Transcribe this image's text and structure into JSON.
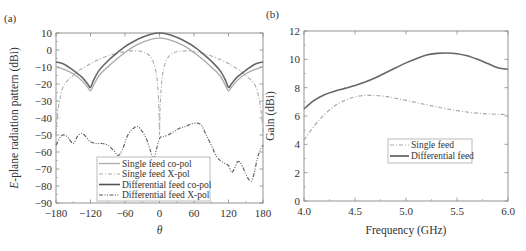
{
  "chart_data": [
    {
      "panel": "(a)",
      "type": "line",
      "xlabel": "θ",
      "ylabel_italic": "E",
      "ylabel_rest": "-plane radiation pattern (dBi)",
      "xlim": [
        -180,
        180
      ],
      "ylim": [
        -90,
        10
      ],
      "xticks": [
        -180,
        -120,
        -60,
        0,
        60,
        120,
        180
      ],
      "yticks": [
        10,
        0,
        -10,
        -20,
        -30,
        -40,
        -50,
        -60,
        -70,
        -80,
        -90
      ],
      "grid": false,
      "legend_position": "lower center",
      "series": [
        {
          "name": "Single feed co-pol",
          "style": "solid",
          "color": "#aaaaaa",
          "width": 1.3,
          "x": [
            -180,
            -165,
            -150,
            -135,
            -125,
            -120,
            -115,
            -105,
            -90,
            -75,
            -60,
            -45,
            -30,
            -15,
            0,
            15,
            30,
            45,
            60,
            75,
            90,
            105,
            115,
            120,
            125,
            135,
            150,
            165,
            180
          ],
          "y": [
            -10,
            -11.5,
            -14,
            -18,
            -22,
            -24,
            -21,
            -15,
            -10,
            -5.5,
            -1.5,
            2,
            4.5,
            6.3,
            7,
            6.3,
            4.5,
            2,
            -1.5,
            -5.5,
            -10,
            -15,
            -21,
            -24,
            -22,
            -18,
            -14,
            -11.5,
            -10
          ]
        },
        {
          "name": "Single feed X-pol",
          "style": "dashdot",
          "color": "#aaaaaa",
          "width": 1.1,
          "x": [
            -180,
            -178,
            -174,
            -168,
            -160,
            -150,
            -140,
            -130,
            -120,
            -105,
            -90,
            -75,
            -60,
            -45,
            -30,
            -20,
            -12,
            -6,
            -3,
            -1,
            0,
            1,
            3,
            6,
            12,
            20,
            30,
            45,
            60,
            75,
            90,
            105,
            120,
            130,
            140,
            150,
            160,
            168,
            174,
            178,
            180
          ],
          "y": [
            -50,
            -40,
            -30,
            -22,
            -18,
            -15,
            -12,
            -10,
            -8,
            -5.5,
            -3.5,
            -2,
            -1,
            -0.5,
            -1,
            -2.5,
            -6,
            -13,
            -22,
            -35,
            -50,
            -35,
            -22,
            -13,
            -6,
            -2.5,
            -1,
            -0.5,
            -1,
            -2,
            -3.5,
            -5.5,
            -8,
            -10,
            -12,
            -15,
            -18,
            -22,
            -30,
            -40,
            -50
          ]
        },
        {
          "name": "Differential feed co-pol",
          "style": "solid",
          "color": "#666666",
          "width": 1.6,
          "x": [
            -180,
            -165,
            -150,
            -135,
            -125,
            -120,
            -115,
            -105,
            -90,
            -75,
            -60,
            -45,
            -30,
            -15,
            0,
            15,
            30,
            45,
            60,
            75,
            90,
            105,
            115,
            120,
            125,
            135,
            150,
            165,
            180
          ],
          "y": [
            -7,
            -8.5,
            -12,
            -16,
            -20,
            -22,
            -18,
            -12,
            -6.5,
            -2,
            2,
            5,
            7.5,
            9.3,
            10,
            9.3,
            7.5,
            5,
            2,
            -2,
            -6.5,
            -12,
            -18,
            -22,
            -20,
            -16,
            -12,
            -8.5,
            -7
          ]
        },
        {
          "name": "Differential feed X-pol",
          "style": "dashdotdot",
          "color": "#666666",
          "width": 1.2,
          "x": [
            -180,
            -172,
            -165,
            -158,
            -150,
            -143,
            -135,
            -128,
            -120,
            -110,
            -100,
            -90,
            -80,
            -72,
            -65,
            -55,
            -45,
            -38,
            -30,
            -22,
            -15,
            -10,
            -5,
            0,
            5,
            15,
            25,
            35,
            45,
            55,
            65,
            72,
            80,
            90,
            100,
            110,
            120,
            125,
            130,
            135,
            140,
            145,
            150,
            155,
            160,
            165,
            170,
            175,
            180
          ],
          "y": [
            -56,
            -51,
            -50,
            -52,
            -55,
            -51,
            -49,
            -51,
            -54,
            -55,
            -55,
            -56,
            -59,
            -62,
            -59,
            -50,
            -46,
            -45,
            -48,
            -53,
            -60,
            -64,
            -58,
            -52,
            -51,
            -50,
            -48,
            -46,
            -45,
            -43.5,
            -43,
            -44,
            -49,
            -56,
            -63,
            -66,
            -68,
            -72,
            -70,
            -66,
            -66,
            -69,
            -73,
            -76,
            -77,
            -72,
            -64,
            -59,
            -56
          ]
        }
      ]
    },
    {
      "panel": "(b)",
      "type": "line",
      "xlabel": "Frequency (GHz)",
      "ylabel": "Gain (dBi)",
      "xlim": [
        4.0,
        6.0
      ],
      "ylim": [
        0,
        12
      ],
      "xticks": [
        4.0,
        4.5,
        5.0,
        5.5,
        6.0
      ],
      "yticks": [
        0,
        2,
        4,
        6,
        8,
        10,
        12
      ],
      "grid": false,
      "legend_position": "center right",
      "series": [
        {
          "name": "Single feed",
          "style": "dashdot",
          "color": "#aaaaaa",
          "width": 1.2,
          "x": [
            4.0,
            4.1,
            4.2,
            4.3,
            4.4,
            4.5,
            4.6,
            4.7,
            4.8,
            4.9,
            5.0,
            5.1,
            5.2,
            5.3,
            5.4,
            5.5,
            5.6,
            5.7,
            5.8,
            5.9,
            6.0
          ],
          "y": [
            4.3,
            5.3,
            6.1,
            6.7,
            7.1,
            7.35,
            7.45,
            7.45,
            7.38,
            7.25,
            7.1,
            6.95,
            6.8,
            6.65,
            6.5,
            6.38,
            6.28,
            6.2,
            6.15,
            6.12,
            6.1
          ]
        },
        {
          "name": "Differential feed",
          "style": "solid",
          "color": "#666666",
          "width": 1.6,
          "x": [
            4.0,
            4.1,
            4.2,
            4.3,
            4.4,
            4.5,
            4.6,
            4.7,
            4.8,
            4.9,
            5.0,
            5.1,
            5.2,
            5.3,
            5.4,
            5.5,
            5.6,
            5.7,
            5.8,
            5.9,
            6.0
          ],
          "y": [
            6.5,
            7.1,
            7.5,
            7.75,
            7.95,
            8.15,
            8.4,
            8.7,
            9.05,
            9.4,
            9.75,
            10.05,
            10.3,
            10.42,
            10.45,
            10.4,
            10.25,
            10.0,
            9.7,
            9.4,
            9.3
          ]
        }
      ]
    }
  ]
}
